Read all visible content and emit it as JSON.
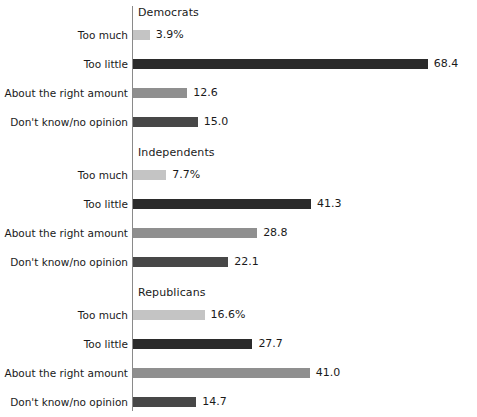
{
  "chart_data": {
    "type": "bar",
    "orientation": "horizontal",
    "title": "",
    "xlabel": "",
    "ylabel": "",
    "xlim": [
      0,
      68.4
    ],
    "grid": false,
    "legend": "none",
    "value_suffix_first_row": "%",
    "categories": [
      "Too much",
      "Too little",
      "About the right amount",
      "Don't know/no opinion"
    ],
    "category_colors": [
      "#c4c4c4",
      "#2b2b2b",
      "#8f8f8f",
      "#474747"
    ],
    "groups": [
      {
        "name": "Democrats",
        "values": [
          3.9,
          68.4,
          12.6,
          15.0
        ],
        "labels": [
          "3.9%",
          "68.4",
          "12.6",
          "15.0"
        ]
      },
      {
        "name": "Independents",
        "values": [
          7.7,
          41.3,
          28.8,
          22.1
        ],
        "labels": [
          "7.7%",
          "41.3",
          "28.8",
          "22.1"
        ]
      },
      {
        "name": "Republicans",
        "values": [
          16.6,
          27.7,
          41.0,
          14.7
        ],
        "labels": [
          "16.6%",
          "27.7",
          "41.0",
          "14.7"
        ]
      }
    ]
  },
  "axis": {
    "baseline_color": "#8a8a8a"
  }
}
